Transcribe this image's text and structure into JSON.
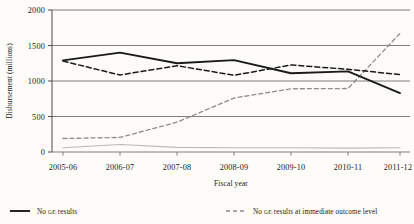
{
  "chart_data": {
    "type": "line",
    "title": "",
    "xlabel": "Fiscal year",
    "ylabel": "Disbursement (millions)",
    "categories": [
      "2005-06",
      "2006-07",
      "2007-08",
      "2008-09",
      "2009-10",
      "2010-11",
      "2011-12"
    ],
    "ylim": [
      0,
      2000
    ],
    "yticks": [
      0,
      500,
      1000,
      1500,
      2000
    ],
    "ytick_labels": [
      "0",
      "500",
      "1000",
      "1500",
      "2000"
    ],
    "grid": true,
    "grid_axis": "y",
    "legend_position": "below-plot",
    "series": [
      {
        "name": "No GE results",
        "style": "solid",
        "color": "#1a1a1a",
        "width": 1.9,
        "values": [
          1290,
          1400,
          1250,
          1295,
          1110,
          1135,
          830
        ]
      },
      {
        "name": "No GE results at intermediate level",
        "style": "dashed",
        "color": "#1a1a1a",
        "width": 1.5,
        "values": [
          1280,
          1085,
          1215,
          1080,
          1225,
          1165,
          1090
        ]
      },
      {
        "name": "No GE results at immediate outcome level",
        "style": "dashed",
        "color": "#8c8c8c",
        "width": 1.2,
        "values": [
          190,
          205,
          420,
          760,
          890,
          895,
          1670
        ]
      },
      {
        "name": "No GE results at output level",
        "style": "solid",
        "color": "#b8b8b8",
        "width": 1.1,
        "values": [
          60,
          105,
          65,
          60,
          60,
          55,
          60
        ]
      }
    ]
  },
  "axis": {
    "ylabel": "Disbursement (millions)",
    "xlabel": "Fiscal year",
    "ytick_labels": [
      "2000",
      "1500",
      "1000",
      "500",
      "0"
    ],
    "xtick_labels": [
      "2005-06",
      "2006-07",
      "2007-08",
      "2008-09",
      "2009-10",
      "2010-11",
      "2011-12"
    ]
  },
  "legend": {
    "items": [
      {
        "label": "No GE results",
        "label_prefix": "No ",
        "label_small": "GE",
        "label_suffix": " results",
        "swatch": "solid-black-line"
      },
      {
        "label": "No GE results at immediate outcome level",
        "label_prefix": "No ",
        "label_small": "GE",
        "label_suffix": " results at immediate outcome level",
        "swatch": "dashed-gray-line"
      }
    ]
  }
}
